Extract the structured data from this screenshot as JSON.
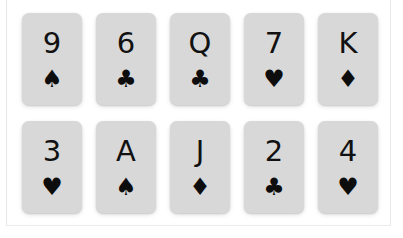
{
  "scene": {
    "title": "Playing card grid",
    "background_color": "#ffffff",
    "frame_border_color": "#e8e8e8",
    "columns": 5,
    "rows": 2
  },
  "card_style": {
    "face_color": "#d8d8d8",
    "ink_color": "#111111",
    "corner_radius": "7px"
  },
  "suit_glyphs": {
    "spades": "♠",
    "hearts": "♥",
    "clubs": "♣",
    "diamonds": "♦"
  },
  "cards": [
    {
      "rank": "9",
      "suit": "♠",
      "suit_name": "spades",
      "label": "9 of Spades"
    },
    {
      "rank": "6",
      "suit": "♣",
      "suit_name": "clubs",
      "label": "6 of Clubs"
    },
    {
      "rank": "Q",
      "suit": "♣",
      "suit_name": "clubs",
      "label": "Queen of Clubs"
    },
    {
      "rank": "7",
      "suit": "♥",
      "suit_name": "hearts",
      "label": "7 of Hearts"
    },
    {
      "rank": "K",
      "suit": "♦",
      "suit_name": "diamonds",
      "label": "King of Diamonds"
    },
    {
      "rank": "3",
      "suit": "♥",
      "suit_name": "hearts",
      "label": "3 of Hearts"
    },
    {
      "rank": "A",
      "suit": "♠",
      "suit_name": "spades",
      "label": "Ace of Spades"
    },
    {
      "rank": "J",
      "suit": "♦",
      "suit_name": "diamonds",
      "label": "Jack of Diamonds"
    },
    {
      "rank": "2",
      "suit": "♣",
      "suit_name": "clubs",
      "label": "2 of Clubs"
    },
    {
      "rank": "4",
      "suit": "♥",
      "suit_name": "hearts",
      "label": "4 of Hearts"
    }
  ]
}
